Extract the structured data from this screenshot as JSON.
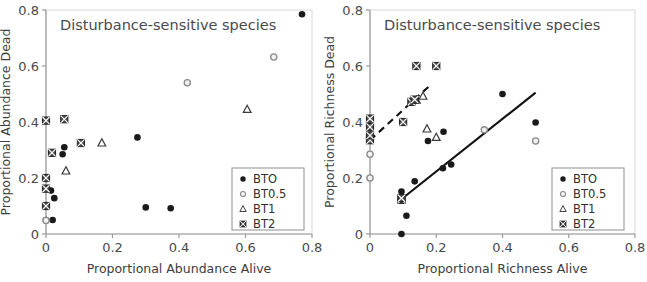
{
  "figure": {
    "panels": [
      "abundance",
      "richness"
    ]
  },
  "chart_data": [
    {
      "id": "abundance",
      "type": "scatter",
      "title": "Disturbance-sensitive species",
      "xlabel": "Proportional Abundance Alive",
      "ylabel": "Proportional Abundance Dead",
      "xlim": [
        0,
        0.8
      ],
      "ylim": [
        0,
        0.8
      ],
      "xticks": [
        "0",
        "0.2",
        "0.4",
        "0.6",
        "0.8"
      ],
      "xtickvals": [
        0,
        0.2,
        0.4,
        0.6,
        0.8
      ],
      "yticks": [
        "0",
        "0.2",
        "0.4",
        "0.6",
        "0.8"
      ],
      "ytickvals": [
        0,
        0.2,
        0.4,
        0.6,
        0.8
      ],
      "grid": false,
      "legend_position": "bottom-right",
      "trendlines": [],
      "series": [
        {
          "name": "BTO",
          "marker": "filled-circle",
          "points": [
            [
              0.0,
              0.05
            ],
            [
              0.02,
              0.05
            ],
            [
              0.015,
              0.155
            ],
            [
              0.025,
              0.128
            ],
            [
              0.05,
              0.285
            ],
            [
              0.055,
              0.31
            ],
            [
              0.275,
              0.345
            ],
            [
              0.3,
              0.095
            ],
            [
              0.375,
              0.092
            ],
            [
              0.77,
              0.785
            ]
          ]
        },
        {
          "name": "BT0.5",
          "marker": "open-circle",
          "points": [
            [
              0.0,
              0.048
            ],
            [
              0.0,
              0.1
            ],
            [
              0.425,
              0.54
            ],
            [
              0.685,
              0.632
            ]
          ]
        },
        {
          "name": "BT1",
          "marker": "open-triangle",
          "points": [
            [
              0.06,
              0.225
            ],
            [
              0.168,
              0.325
            ],
            [
              0.605,
              0.445
            ]
          ]
        },
        {
          "name": "BT2",
          "marker": "crossed-square",
          "points": [
            [
              0.0,
              0.1
            ],
            [
              0.0,
              0.162
            ],
            [
              0.0,
              0.2
            ],
            [
              0.0,
              0.405
            ],
            [
              0.018,
              0.29
            ],
            [
              0.055,
              0.41
            ],
            [
              0.105,
              0.325
            ]
          ]
        }
      ]
    },
    {
      "id": "richness",
      "type": "scatter",
      "title": "Disturbance-sensitive species",
      "xlabel": "Proportional Richness Alive",
      "ylabel": "Proportional Richness Dead",
      "xlim": [
        0,
        0.8
      ],
      "ylim": [
        0,
        0.8
      ],
      "xticks": [
        "0",
        "0.2",
        "0.4",
        "0.6",
        "0.8"
      ],
      "xtickvals": [
        0,
        0.2,
        0.4,
        0.6,
        0.8
      ],
      "yticks": [
        "0",
        "0.2",
        "0.4",
        "0.6",
        "0.8"
      ],
      "ytickvals": [
        0,
        0.2,
        0.4,
        0.6,
        0.8
      ],
      "grid": false,
      "legend_position": "bottom-right",
      "trendlines": [
        {
          "name": "solid-fit",
          "style": "solid",
          "x0": 0.085,
          "y0": 0.115,
          "x1": 0.5,
          "y1": 0.505
        },
        {
          "name": "dashed-fit",
          "style": "dashed",
          "x0": 0.0,
          "y0": 0.335,
          "x1": 0.185,
          "y1": 0.535
        }
      ],
      "series": [
        {
          "name": "BTO",
          "marker": "filled-circle",
          "points": [
            [
              0.095,
              0.0
            ],
            [
              0.11,
              0.065
            ],
            [
              0.095,
              0.152
            ],
            [
              0.135,
              0.188
            ],
            [
              0.175,
              0.332
            ],
            [
              0.22,
              0.235
            ],
            [
              0.245,
              0.248
            ],
            [
              0.222,
              0.365
            ],
            [
              0.4,
              0.5
            ],
            [
              0.5,
              0.398
            ]
          ]
        },
        {
          "name": "BT0.5",
          "marker": "open-circle",
          "points": [
            [
              0.0,
              0.2
            ],
            [
              0.0,
              0.285
            ],
            [
              0.345,
              0.372
            ],
            [
              0.5,
              0.332
            ]
          ]
        },
        {
          "name": "BT1",
          "marker": "open-triangle",
          "points": [
            [
              0.14,
              0.478
            ],
            [
              0.16,
              0.492
            ],
            [
              0.172,
              0.375
            ],
            [
              0.2,
              0.345
            ]
          ]
        },
        {
          "name": "BT2",
          "marker": "crossed-square",
          "points": [
            [
              0.0,
              0.335
            ],
            [
              0.0,
              0.352
            ],
            [
              0.0,
              0.382
            ],
            [
              0.0,
              0.412
            ],
            [
              0.095,
              0.122
            ],
            [
              0.095,
              0.128
            ],
            [
              0.1,
              0.4
            ],
            [
              0.125,
              0.472
            ],
            [
              0.135,
              0.48
            ],
            [
              0.14,
              0.6
            ],
            [
              0.2,
              0.6
            ]
          ]
        }
      ]
    }
  ],
  "legend": {
    "items": [
      {
        "label": "BTO",
        "marker": "filled-circle"
      },
      {
        "label": "BT0.5",
        "marker": "open-circle"
      },
      {
        "label": "BT1",
        "marker": "open-triangle"
      },
      {
        "label": "BT2",
        "marker": "crossed-square"
      }
    ]
  },
  "colors": {
    "axis": "#9a9a9a",
    "text": "#4a4a4a",
    "marker_dark": "#1a1a1a",
    "marker_open": "#8a8a8a",
    "trendline": "#111111",
    "legend_border": "#8f8f8f",
    "background": "#ffffff"
  }
}
